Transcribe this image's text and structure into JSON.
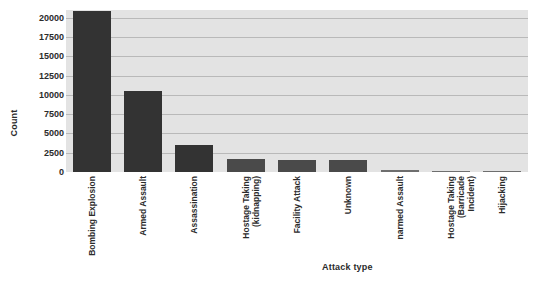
{
  "chart_data": {
    "type": "bar",
    "title": "",
    "xlabel": "Attack type",
    "ylabel": "Count",
    "grid": true,
    "legend": false,
    "ylim": [
      0,
      21000
    ],
    "yticks": [
      0,
      2500,
      5000,
      7500,
      10000,
      12500,
      15000,
      17500,
      20000
    ],
    "ytick_labels": [
      "0",
      "2500",
      "5000",
      "7500",
      "10000",
      "12500",
      "15000",
      "17500",
      "20000"
    ],
    "categories": [
      "Bombing Explosion",
      "Armed Assault",
      "Assassination",
      "Hostage Taking\n(kidnapping)",
      "Facility Attack",
      "Unknown",
      "narmed Assault",
      "Hostage Taking\n(Barricade\nIncident)",
      "Hijacking"
    ],
    "values": [
      20900,
      10450,
      3550,
      1650,
      1600,
      1550,
      280,
      60,
      40
    ],
    "colors": {
      "bar_dark": "#333333",
      "bar_mid": "#4a4a4a",
      "bar_light": "#6e6e6e",
      "plot_background": "#e3e3e3",
      "gridline": "#b9b9b9",
      "text": "#2b2b2b",
      "figure_background": "#ffffff"
    }
  }
}
